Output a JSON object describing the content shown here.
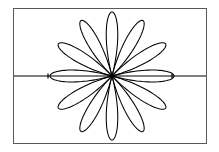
{
  "figure": {
    "title": "",
    "background_color": "#ffffff",
    "frame": {
      "name": "plot-frame",
      "x": 13,
      "y": 8,
      "width": 194,
      "height": 136,
      "border_color": "#555a5e",
      "border_width": 1
    }
  },
  "chart_data": {
    "type": "line",
    "subtype": "polar-rose",
    "title": "",
    "xlabel": "",
    "ylabel": "",
    "grid": false,
    "legend": null,
    "curve_color": "#000000",
    "curve_label": "r = cos(6θ)",
    "petal_count": 12,
    "petal_angle_step_deg": 30,
    "center": {
      "x": 112,
      "y": 76
    },
    "radius_x_px": 62,
    "radius_y_px": 64,
    "petal_half_width_deg": 15,
    "petal_angles_deg": [
      0,
      30,
      60,
      90,
      120,
      150,
      180,
      210,
      240,
      270,
      300,
      330
    ],
    "theta_samples": 721,
    "r_formula": "abs(cos(6*theta))",
    "axis": {
      "name": "horizontal-axis",
      "orientation": "horizontal",
      "y": 76,
      "x_start": 14,
      "x_end": 206,
      "color": "#000000",
      "ticks": [
        {
          "label": "",
          "x": 48,
          "length": 5
        },
        {
          "label": "",
          "x": 172,
          "length": 5
        }
      ]
    },
    "series": [
      {
        "name": "rose-curve",
        "theta_deg": [
          0,
          15,
          30,
          45,
          60,
          75,
          90,
          105,
          120,
          135,
          150,
          165,
          180,
          195,
          210,
          225,
          240,
          255,
          270,
          285,
          300,
          315,
          330,
          345,
          360
        ],
        "r": [
          1,
          0,
          1,
          0,
          1,
          0,
          1,
          0,
          1,
          0,
          1,
          0,
          1,
          0,
          1,
          0,
          1,
          0,
          1,
          0,
          1,
          0,
          1,
          0,
          1
        ]
      }
    ],
    "rlim": [
      0,
      1
    ],
    "theta_lim_deg": [
      0,
      360
    ]
  }
}
